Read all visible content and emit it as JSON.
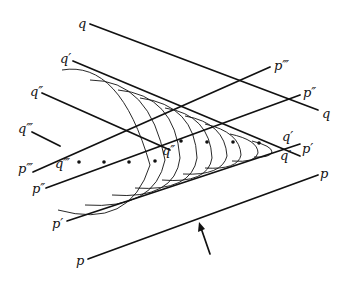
{
  "diagram": {
    "type": "wavefront-construction",
    "labels": {
      "q": "q",
      "q_right": "q",
      "q1": "q′",
      "q1_apex_top": "q′",
      "q1_apex_bottom": "q′",
      "q2": "q″",
      "q2_center": "q″",
      "q3": "q‴",
      "q3_center": "q‴",
      "p": "p",
      "p_right": "p",
      "p1": "p′",
      "p1_right": "p′",
      "p2": "p″",
      "p2_right": "p″",
      "p3": "p‴",
      "p3_right": "p‴"
    },
    "colors": {
      "ink": "#111111",
      "background": "#ffffff"
    }
  }
}
